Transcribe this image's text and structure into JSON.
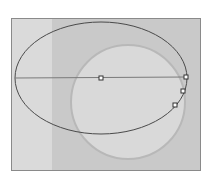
{
  "canvas": {
    "background": "#c9c9c9",
    "left_strip_color": "#dadada",
    "border_color": "#8a8a8a"
  },
  "shapes": {
    "ellipse": {
      "cx": 101,
      "cy": 78,
      "rx": 86,
      "ry": 56,
      "stroke": "#4a4a4a"
    },
    "circle": {
      "cx": 128,
      "cy": 102,
      "r": 57,
      "fill": "#d9d9d9",
      "stroke": "#b8b8b8"
    },
    "axis_line": {
      "x1": 15,
      "y1": 78,
      "x2": 187,
      "y2": 77,
      "stroke": "#7a7a7a"
    },
    "handles": [
      {
        "name": "center-handle",
        "x": 101,
        "y": 78
      },
      {
        "name": "edge-handle-1",
        "x": 186,
        "y": 77
      },
      {
        "name": "edge-handle-2",
        "x": 183,
        "y": 91
      },
      {
        "name": "edge-handle-3",
        "x": 175,
        "y": 105
      }
    ]
  }
}
